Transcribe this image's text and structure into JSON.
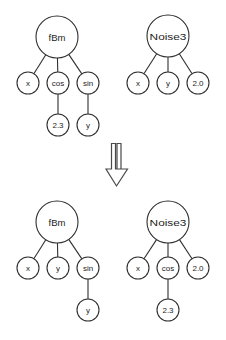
{
  "figure": {
    "name": "genetic-programming-crossover",
    "background": "#ffffff",
    "stroke_color": "#2f2f2f",
    "text_color": "#1d1d1d",
    "arrow_color": "#4a4a4a"
  },
  "operator": {
    "glyph": "double-down-arrow",
    "name": "crossover-arrow"
  },
  "trees": [
    {
      "id": "parent-1",
      "position": "top-left",
      "root": {
        "label": "fBm",
        "cx": 57,
        "cy": 37,
        "r": 21
      },
      "nodes": [
        {
          "id": "p1-root",
          "label": "fBm",
          "cx": 57,
          "cy": 37,
          "r": 21,
          "size": "root"
        },
        {
          "id": "p1-x",
          "label": "x",
          "cx": 28,
          "cy": 83,
          "r": 11,
          "size": "leaf"
        },
        {
          "id": "p1-cos",
          "label": "cos",
          "cx": 58,
          "cy": 83,
          "r": 11,
          "size": "leaf"
        },
        {
          "id": "p1-sin",
          "label": "sin",
          "cx": 88,
          "cy": 83,
          "r": 11,
          "size": "leaf"
        },
        {
          "id": "p1-23",
          "label": "2.3",
          "cx": 58,
          "cy": 125,
          "r": 11,
          "size": "leaf"
        },
        {
          "id": "p1-y",
          "label": "y",
          "cx": 88,
          "cy": 125,
          "r": 11,
          "size": "leaf"
        }
      ],
      "edges": [
        {
          "from": "p1-root",
          "to": "p1-x"
        },
        {
          "from": "p1-root",
          "to": "p1-cos"
        },
        {
          "from": "p1-root",
          "to": "p1-sin"
        },
        {
          "from": "p1-cos",
          "to": "p1-23"
        },
        {
          "from": "p1-sin",
          "to": "p1-y"
        }
      ]
    },
    {
      "id": "parent-2",
      "position": "top-right",
      "root": {
        "label": "Noise3",
        "cx": 168,
        "cy": 36,
        "r": 21
      },
      "nodes": [
        {
          "id": "p2-root",
          "label": "Noise3",
          "cx": 168,
          "cy": 36,
          "r": 21,
          "size": "root"
        },
        {
          "id": "p2-x",
          "label": "x",
          "cx": 138,
          "cy": 83,
          "r": 11,
          "size": "leaf"
        },
        {
          "id": "p2-y",
          "label": "y",
          "cx": 168,
          "cy": 83,
          "r": 11,
          "size": "leaf"
        },
        {
          "id": "p2-20",
          "label": "2.0",
          "cx": 198,
          "cy": 83,
          "r": 11,
          "size": "leaf"
        }
      ],
      "edges": [
        {
          "from": "p2-root",
          "to": "p2-x"
        },
        {
          "from": "p2-root",
          "to": "p2-y"
        },
        {
          "from": "p2-root",
          "to": "p2-20"
        }
      ]
    },
    {
      "id": "child-1",
      "position": "bottom-left",
      "root": {
        "label": "fBm",
        "cx": 57,
        "cy": 222,
        "r": 21
      },
      "nodes": [
        {
          "id": "c1-root",
          "label": "fBm",
          "cx": 57,
          "cy": 222,
          "r": 21,
          "size": "root"
        },
        {
          "id": "c1-x",
          "label": "x",
          "cx": 28,
          "cy": 268,
          "r": 11,
          "size": "leaf"
        },
        {
          "id": "c1-y",
          "label": "y",
          "cx": 58,
          "cy": 268,
          "r": 11,
          "size": "leaf"
        },
        {
          "id": "c1-sin",
          "label": "sin",
          "cx": 88,
          "cy": 268,
          "r": 11,
          "size": "leaf"
        },
        {
          "id": "c1-y2",
          "label": "y",
          "cx": 88,
          "cy": 310,
          "r": 11,
          "size": "leaf"
        }
      ],
      "edges": [
        {
          "from": "c1-root",
          "to": "c1-x"
        },
        {
          "from": "c1-root",
          "to": "c1-y"
        },
        {
          "from": "c1-root",
          "to": "c1-sin"
        },
        {
          "from": "c1-sin",
          "to": "c1-y2"
        }
      ]
    },
    {
      "id": "child-2",
      "position": "bottom-right",
      "root": {
        "label": "Noise3",
        "cx": 168,
        "cy": 222,
        "r": 21
      },
      "nodes": [
        {
          "id": "c2-root",
          "label": "Noise3",
          "cx": 168,
          "cy": 222,
          "r": 21,
          "size": "root"
        },
        {
          "id": "c2-x",
          "label": "x",
          "cx": 138,
          "cy": 268,
          "r": 11,
          "size": "leaf"
        },
        {
          "id": "c2-cos",
          "label": "cos",
          "cx": 168,
          "cy": 268,
          "r": 11,
          "size": "leaf"
        },
        {
          "id": "c2-20",
          "label": "2.0",
          "cx": 198,
          "cy": 268,
          "r": 11,
          "size": "leaf"
        },
        {
          "id": "c2-23",
          "label": "2.3",
          "cx": 168,
          "cy": 310,
          "r": 11,
          "size": "leaf"
        }
      ],
      "edges": [
        {
          "from": "c2-root",
          "to": "c2-x"
        },
        {
          "from": "c2-root",
          "to": "c2-cos"
        },
        {
          "from": "c2-root",
          "to": "c2-20"
        },
        {
          "from": "c2-cos",
          "to": "c2-23"
        }
      ]
    }
  ]
}
